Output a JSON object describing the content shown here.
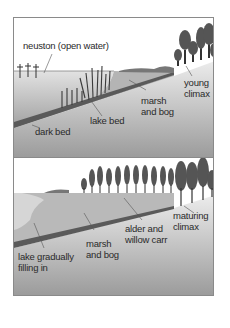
{
  "diagram": {
    "colors": {
      "sky": "#ffffff",
      "ground_light": "#e6e6e6",
      "ground_dark": "#9a9a9a",
      "water": "#bdbdbd",
      "sediment": "#a8a8a8",
      "dark_bed": "#5a5a5a",
      "trees": "#555555",
      "frame": "#8a8a8a",
      "text": "#2a2a2a"
    },
    "panels": [
      {
        "id": "top",
        "stage": "early",
        "labels": {
          "neuston": "neuston (open water)",
          "dark_bed": "dark bed",
          "lake_bed": "lake bed",
          "marsh_line1": "marsh",
          "marsh_line2": "and bog",
          "climax_line1": "young",
          "climax_line2": "climax"
        }
      },
      {
        "id": "bottom",
        "stage": "late",
        "labels": {
          "lake_line1": "lake gradually",
          "lake_line2": "filling in",
          "marsh_line1": "marsh",
          "marsh_line2": "and bog",
          "carr_line1": "alder and",
          "carr_line2": "willow carr",
          "climax_line1": "maturing",
          "climax_line2": "climax"
        }
      }
    ]
  }
}
